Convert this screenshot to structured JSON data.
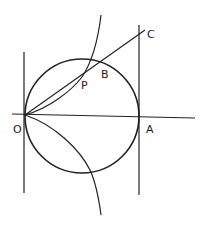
{
  "diagram": {
    "title": "",
    "labels": {
      "O": "O",
      "A": "A",
      "B": "B",
      "C": "C",
      "P": "P"
    },
    "stroke_color": "#222222",
    "background": "#ffffff",
    "elements": [
      "circle with diameter OA",
      "horizontal axis through O and A",
      "vertical tangent line at O",
      "vertical tangent line at A",
      "line from O through B to C",
      "cissoid curve through O and P (upper and lower branches)"
    ]
  }
}
